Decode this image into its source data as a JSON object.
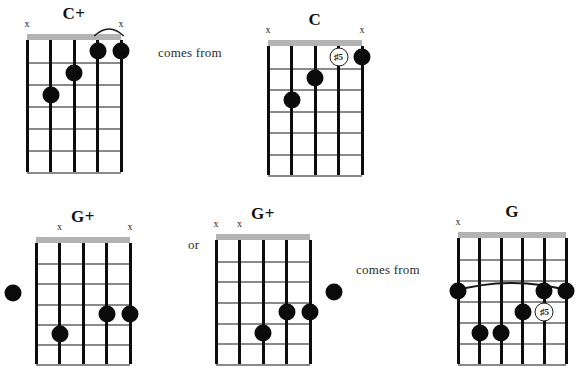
{
  "page": {
    "width": 586,
    "height": 369,
    "background": "#ffffff",
    "ink": "#0b0b0b",
    "nut_color": "#b3b3b3",
    "fret_color": "#8a8a8a"
  },
  "connectors": [
    {
      "id": "comes-from-top",
      "text": "comes from",
      "x": 158,
      "y": 45
    },
    {
      "id": "or-middle",
      "text": "or",
      "x": 188,
      "y": 237
    },
    {
      "id": "comes-from-bottom",
      "text": "comes from",
      "x": 356,
      "y": 262
    }
  ],
  "diagrams": [
    {
      "id": "chord-c-aug",
      "title": "C+",
      "x": 27,
      "y": 34,
      "width": 94,
      "height": 138,
      "strings": 5,
      "frets": 6,
      "mutes": [
        1,
        5
      ],
      "open_strings": [],
      "partial_barre": {
        "from_string": 4,
        "to_string": 5,
        "fret": 1
      },
      "full_barre": null,
      "dots": [
        {
          "string": 4,
          "fret": 1
        },
        {
          "string": 5,
          "fret": 1
        },
        {
          "string": 3,
          "fret": 2
        },
        {
          "string": 2,
          "fret": 3
        }
      ],
      "markers": []
    },
    {
      "id": "chord-c",
      "title": "C",
      "x": 268,
      "y": 40,
      "width": 94,
      "height": 135,
      "strings": 5,
      "frets": 6,
      "mutes": [
        1,
        5
      ],
      "open_strings": [],
      "partial_barre": null,
      "full_barre": null,
      "dots": [
        {
          "string": 5,
          "fret": 1
        },
        {
          "string": 3,
          "fret": 2
        },
        {
          "string": 2,
          "fret": 3
        }
      ],
      "markers": [
        {
          "string": 4,
          "fret": 1,
          "label": "♯5"
        }
      ]
    },
    {
      "id": "chord-g-aug-1",
      "title": "G+",
      "x": 36,
      "y": 237,
      "width": 94,
      "height": 127,
      "strings": 5,
      "frets": 6,
      "mutes": [
        2,
        5
      ],
      "open_strings": [],
      "partial_barre": null,
      "full_barre": null,
      "dots": [
        {
          "string": 0,
          "fret": 3
        },
        {
          "string": 4,
          "fret": 4
        },
        {
          "string": 5,
          "fret": 4
        },
        {
          "string": 2,
          "fret": 5
        }
      ],
      "markers": []
    },
    {
      "id": "chord-g-aug-2",
      "title": "G+",
      "x": 216,
      "y": 234,
      "width": 94,
      "height": 130,
      "strings": 5,
      "frets": 6,
      "mutes": [
        1,
        2
      ],
      "open_strings": [],
      "partial_barre": null,
      "full_barre": null,
      "dots": [
        {
          "string": 6,
          "fret": 3
        },
        {
          "string": 4,
          "fret": 4
        },
        {
          "string": 5,
          "fret": 4
        },
        {
          "string": 3,
          "fret": 5
        }
      ],
      "markers": []
    },
    {
      "id": "chord-g",
      "title": "G",
      "x": 458,
      "y": 232,
      "width": 108,
      "height": 132,
      "strings": 6,
      "frets": 6,
      "mutes": [
        1
      ],
      "open_strings": [],
      "partial_barre": null,
      "full_barre": {
        "from_string": 1,
        "to_string": 6,
        "fret": 3
      },
      "dots": [
        {
          "string": 1,
          "fret": 3
        },
        {
          "string": 5,
          "fret": 3
        },
        {
          "string": 6,
          "fret": 3
        },
        {
          "string": 4,
          "fret": 4
        },
        {
          "string": 2,
          "fret": 5
        },
        {
          "string": 3,
          "fret": 5
        }
      ],
      "markers": [
        {
          "string": 5,
          "fret": 4,
          "label": "♯5"
        }
      ]
    }
  ]
}
